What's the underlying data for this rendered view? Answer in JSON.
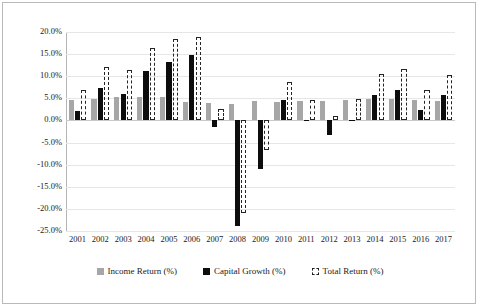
{
  "chart_data": {
    "type": "bar",
    "title": "",
    "xlabel": "",
    "ylabel": "",
    "ylim": [
      -25,
      20
    ],
    "ytick_step": 5,
    "grid": true,
    "legend_position": "bottom",
    "categories": [
      "2001",
      "2002",
      "2003",
      "2004",
      "2005",
      "2006",
      "2007",
      "2008",
      "2009",
      "2010",
      "2011",
      "2012",
      "2013",
      "2014",
      "2015",
      "2016",
      "2017"
    ],
    "ytick_labels": [
      "20.0%",
      "15.0%",
      "10.0%",
      "5.0%",
      "0.0%",
      "-5.0%",
      "-10.0%",
      "-15.0%",
      "-20.0%",
      "-25.0%"
    ],
    "ytick_values": [
      20,
      15,
      10,
      5,
      0,
      -5,
      -10,
      -15,
      -20,
      -25
    ],
    "series": [
      {
        "name": "Income Return (%)",
        "color": "#a6a6a6",
        "style": "solid",
        "values": [
          4.6,
          4.8,
          5.3,
          5.3,
          5.3,
          4.2,
          4.0,
          3.7,
          4.4,
          4.2,
          4.4,
          4.4,
          4.6,
          4.8,
          4.8,
          4.6,
          4.4
        ]
      },
      {
        "name": "Capital Growth (%)",
        "color": "#0d0d0d",
        "style": "solid",
        "values": [
          2.2,
          7.3,
          6.0,
          11.1,
          13.2,
          14.7,
          -1.5,
          -23.8,
          -11.0,
          4.6,
          0.2,
          -3.3,
          0.2,
          5.8,
          6.9,
          2.3,
          5.8
        ]
      },
      {
        "name": "Total Return (%)",
        "color": "#242424",
        "style": "dashed-outline",
        "values": [
          6.8,
          12.1,
          11.3,
          16.4,
          18.5,
          18.9,
          2.5,
          -20.9,
          -6.6,
          8.8,
          4.6,
          1.1,
          4.8,
          10.6,
          11.7,
          6.9,
          10.2
        ]
      }
    ],
    "legend": [
      {
        "label": "Income Return (%)",
        "swatch": "income"
      },
      {
        "label": "Capital Growth (%)",
        "swatch": "capital"
      },
      {
        "label": "Total Return (%)",
        "swatch": "total"
      }
    ]
  }
}
